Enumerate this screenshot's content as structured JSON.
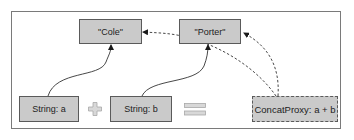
{
  "diagram": {
    "nodes": {
      "cole": {
        "label": "\"Cole\""
      },
      "porter": {
        "label": "\"Porter\""
      },
      "string_a": {
        "label": "String: a"
      },
      "string_b": {
        "label": "String: b"
      },
      "concat_proxy": {
        "label": "ConcatProxy: a + b"
      }
    },
    "operators": {
      "plus": {
        "symbol": "plus-icon"
      },
      "equals": {
        "symbol": "equals-icon"
      }
    },
    "edges": [
      {
        "from": "string_a",
        "to": "cole",
        "style": "solid"
      },
      {
        "from": "string_b",
        "to": "porter",
        "style": "solid"
      },
      {
        "from": "concat_proxy",
        "to": "cole",
        "style": "dashed"
      },
      {
        "from": "concat_proxy",
        "to": "porter",
        "style": "dashed"
      }
    ],
    "colors": {
      "box_fill": "#cacaca",
      "box_border": "#5a5a5a",
      "operator_fill": "#d8d8d8",
      "operator_border": "#a8a8a8",
      "frame_border": "#7a7a7a",
      "edge": "#333333"
    }
  }
}
